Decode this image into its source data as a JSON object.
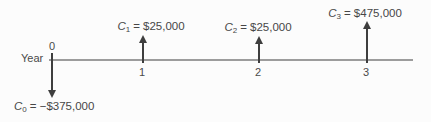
{
  "axis": {
    "label": "Year"
  },
  "events": [
    {
      "year": "0",
      "flow_var": "C",
      "flow_sub": "0",
      "flow_value": "= −$375,000",
      "direction": "down",
      "amount": -375000
    },
    {
      "year": "1",
      "flow_var": "C",
      "flow_sub": "1",
      "flow_value": "= $25,000",
      "direction": "up",
      "amount": 25000
    },
    {
      "year": "2",
      "flow_var": "C",
      "flow_sub": "2",
      "flow_value": "= $25,000",
      "direction": "up",
      "amount": 25000
    },
    {
      "year": "3",
      "flow_var": "C",
      "flow_sub": "3",
      "flow_value": "= $475,000",
      "direction": "up",
      "amount": 475000
    }
  ],
  "colors": {
    "background": "#fcfcfc",
    "timeline": "#9c9c9c",
    "arrow": "#3e3e3e",
    "text": "#4a4a4a"
  },
  "chart_data": {
    "type": "bar",
    "xlabel": "Year",
    "ylabel": "Cash flow ($)",
    "categories": [
      0,
      1,
      2,
      3
    ],
    "values": [
      -375000,
      25000,
      25000,
      475000
    ],
    "annotations": [
      "C0 = −$375,000",
      "C1 = $25,000",
      "C2 = $25,000",
      "C3 = $475,000"
    ],
    "legend": "none",
    "grid": false
  }
}
